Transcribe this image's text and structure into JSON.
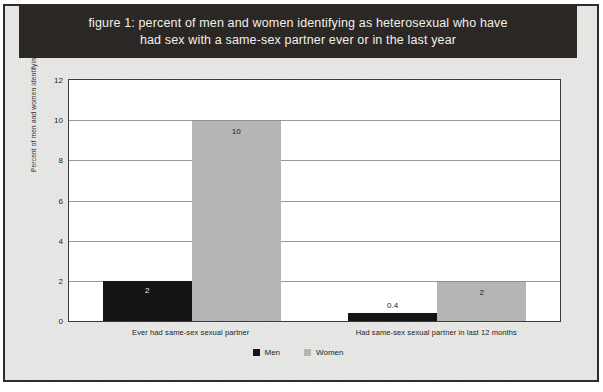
{
  "figure": {
    "title_line1": "figure 1: percent of men and women identifying as heterosexual who have",
    "title_line2": "had sex with a same-sex partner ever or in the last year",
    "title_bg_color": "#2b2724",
    "title_text_color": "#f2f0ee",
    "page_bg_color": "#e8e8e6",
    "plot_bg_color": "#ffffff"
  },
  "chart_data": {
    "type": "bar",
    "title": "figure 1: percent of men and women identifying as heterosexual who have had sex with a same-sex partner ever or in the last year",
    "xlabel": "",
    "ylabel": "Percent of men and women identifying as heterosexual",
    "ylim": [
      0,
      12
    ],
    "yticks": [
      0,
      2,
      4,
      6,
      8,
      10,
      12
    ],
    "ytick_labels": [
      "0",
      "2",
      "4",
      "6",
      "8",
      "10",
      "12"
    ],
    "grid": true,
    "legend_position": "bottom-center",
    "categories": [
      "Ever had same-sex sexual partner",
      "Had same-sex sexual partner in last 12 months"
    ],
    "series": [
      {
        "name": "Men",
        "color": "#141414",
        "values": [
          2,
          0.4
        ],
        "value_labels": [
          "2",
          "0.4"
        ]
      },
      {
        "name": "Women",
        "color": "#b5b5b5",
        "values": [
          10,
          2
        ],
        "value_labels": [
          "10",
          "2"
        ]
      }
    ]
  }
}
